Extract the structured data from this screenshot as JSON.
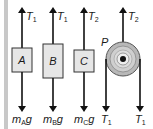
{
  "diagram": {
    "type": "free-body diagram",
    "blocks": [
      {
        "id": "A",
        "label": "A",
        "tension_label": "T",
        "tension_sub": "1",
        "weight_label": "m",
        "weight_sub": "A",
        "weight_suffix": "g"
      },
      {
        "id": "B",
        "label": "B",
        "tension_label": "T",
        "tension_sub": "1",
        "weight_label": "m",
        "weight_sub": "B",
        "weight_suffix": "g"
      },
      {
        "id": "C",
        "label": "C",
        "tension_label": "T",
        "tension_sub": "2",
        "weight_label": "m",
        "weight_sub": "C",
        "weight_suffix": "g"
      }
    ],
    "pulley": {
      "label": "P",
      "up_label": "T",
      "up_sub": "2",
      "down_left_label": "T",
      "down_left_sub": "1",
      "down_right_label": "T",
      "down_right_sub": "1"
    },
    "colors": {
      "block_fill": "#e6e6e6",
      "block_stroke": "#333333",
      "arrow": "#111111",
      "wall": "#c8c8c8",
      "pulley_outer": "#b8b8b8",
      "pulley_inner": "#d8d8d8"
    }
  }
}
